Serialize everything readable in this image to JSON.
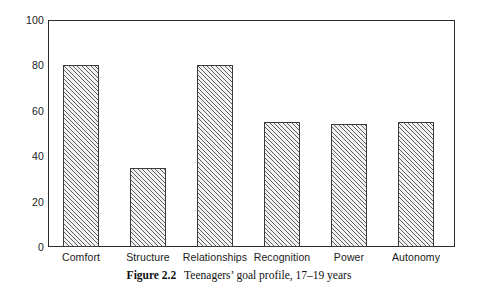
{
  "chart_data": {
    "type": "bar",
    "title": "",
    "categories": [
      "Comfort",
      "Structure",
      "Relationships",
      "Recognition",
      "Power",
      "Autonomy"
    ],
    "values": [
      80,
      35,
      80,
      55,
      54,
      55
    ],
    "xlabel": "",
    "ylabel": "",
    "ylim": [
      0,
      100
    ],
    "ytick_labels": [
      "0",
      "20",
      "40",
      "60",
      "80",
      "100"
    ],
    "ytick_values": [
      0,
      20,
      40,
      60,
      80,
      100
    ],
    "yminor_tick_values": [
      10,
      30,
      50,
      70,
      90
    ],
    "grid": false,
    "legend": null,
    "bar_fill": "diagonal-hatch",
    "bar_edge_color": "#3a3a3a",
    "axis_color": "#2b2b2b",
    "background": "#ffffff"
  },
  "caption": {
    "figure_word": "Figure",
    "figure_number": "2.2",
    "text": "Teenagers’ goal profile, 17–19 years"
  }
}
